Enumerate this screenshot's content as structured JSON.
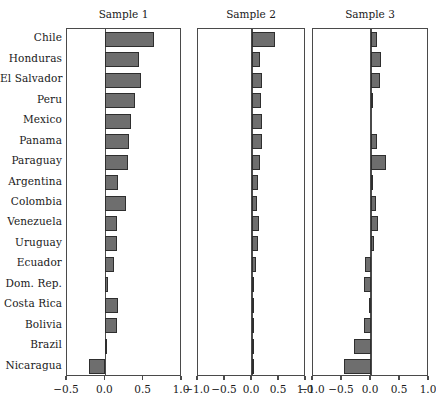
{
  "chart_data": {
    "type": "bar",
    "orientation": "horizontal",
    "title": "",
    "xlabel": "",
    "ylabel": "",
    "grid": false,
    "legend": "none",
    "categories": [
      "Chile",
      "Honduras",
      "El Salvador",
      "Peru",
      "Mexico",
      "Panama",
      "Paraguay",
      "Argentina",
      "Colombia",
      "Venezuela",
      "Uruguay",
      "Ecuador",
      "Dom. Rep.",
      "Costa Rica",
      "Bolivia",
      "Brazil",
      "Nicaragua"
    ],
    "panels": [
      {
        "title": "Sample 1",
        "xlim": [
          -0.5,
          1.0
        ],
        "xticks": [
          -0.5,
          0.0,
          0.5,
          1.0
        ],
        "xticklabels": [
          "-0.5",
          "0.0",
          "0.5",
          "1.0"
        ],
        "values": [
          0.64,
          0.44,
          0.47,
          0.39,
          0.33,
          0.31,
          0.3,
          0.17,
          0.27,
          0.15,
          0.15,
          0.11,
          0.03,
          0.17,
          0.15,
          0.02,
          -0.21
        ]
      },
      {
        "title": "Sample 2",
        "xlim": [
          -1.0,
          1.0
        ],
        "xticks": [
          -1.0,
          -0.5,
          0.0,
          0.5,
          1.0
        ],
        "xticklabels": [
          "-1.0",
          "-0.5",
          "0.0",
          "0.5",
          "1.0"
        ],
        "values": [
          0.42,
          0.15,
          0.18,
          0.17,
          0.19,
          0.19,
          0.14,
          0.12,
          0.1,
          0.13,
          0.11,
          0.07,
          0.03,
          0.01,
          0.02,
          0.04,
          0.04
        ]
      },
      {
        "title": "Sample 3",
        "xlim": [
          -1.0,
          1.0
        ],
        "xticks": [
          -1.0,
          -0.5,
          0.0,
          0.5,
          1.0
        ],
        "xticklabels": [
          "-1.0",
          "-0.5",
          "0.0",
          "0.5",
          "1.0"
        ],
        "values": [
          0.1,
          0.17,
          0.15,
          0.04,
          0.0,
          0.1,
          0.26,
          0.04,
          0.09,
          0.12,
          0.05,
          -0.11,
          -0.12,
          -0.04,
          -0.12,
          -0.3,
          -0.47
        ]
      }
    ]
  },
  "series_colors": {
    "bar_fill": "#6e6e6e",
    "bar_stroke": "#2e2e2e",
    "axis": "#4a4a4a",
    "background": "#ffffff"
  }
}
